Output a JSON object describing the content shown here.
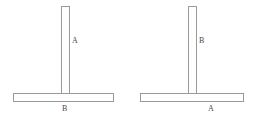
{
  "diagram": {
    "type": "mechanical-member-diagram",
    "background_color": "#ffffff",
    "stroke_color": "#9a9a9a",
    "fill_color": "#fefefe",
    "label_color": "#4a4a4a",
    "figures": [
      {
        "id": "left",
        "description": "T-shaped assembly: tall narrow vertical member standing on a long horizontal member",
        "vertical_member": {
          "label": "A",
          "orientation": "vertical",
          "length_px": 91,
          "thickness_px": 9
        },
        "horizontal_member": {
          "label": "B",
          "orientation": "horizontal",
          "length_px": 101,
          "thickness_px": 9
        }
      },
      {
        "id": "right",
        "description": "T-shaped assembly with labels swapped: vertical member is B, horizontal member is A",
        "vertical_member": {
          "label": "B",
          "orientation": "vertical",
          "length_px": 91,
          "thickness_px": 9
        },
        "horizontal_member": {
          "label": "A",
          "orientation": "horizontal",
          "length_px": 104,
          "thickness_px": 9
        }
      }
    ]
  }
}
